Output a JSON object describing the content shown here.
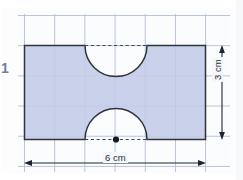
{
  "page": {
    "question_number": "1",
    "background_color": "#ffffff",
    "grid_color": "#b9c3d6",
    "subgrid_color": "#dfe6f1"
  },
  "figure": {
    "type": "compound-shape",
    "fill_color": "#c3cbe8",
    "outline_color": "#30343d",
    "dash_color": "#5b6476",
    "rectangle": {
      "x": 24.5,
      "y": 45.5,
      "width": 181,
      "height": 94,
      "width_label": "6 cm",
      "height_label": "3 cm"
    },
    "semicircles": [
      {
        "name": "top-notch",
        "center_x": 116,
        "center_y": 45.5,
        "radius": 31,
        "opens": "downward",
        "chord_dashed": true
      },
      {
        "name": "bottom-notch",
        "center_x": 116,
        "center_y": 139.5,
        "radius": 31,
        "opens": "upward",
        "chord_dashed": true,
        "center_dot": true
      }
    ]
  },
  "dimensions": {
    "width": {
      "label": "6 cm",
      "arrow_y": 163,
      "x_start": 24.5,
      "x_end": 205.5
    },
    "height": {
      "label": "3 cm",
      "arrow_x": 222,
      "y_start": 45.5,
      "y_end": 139.5
    }
  }
}
